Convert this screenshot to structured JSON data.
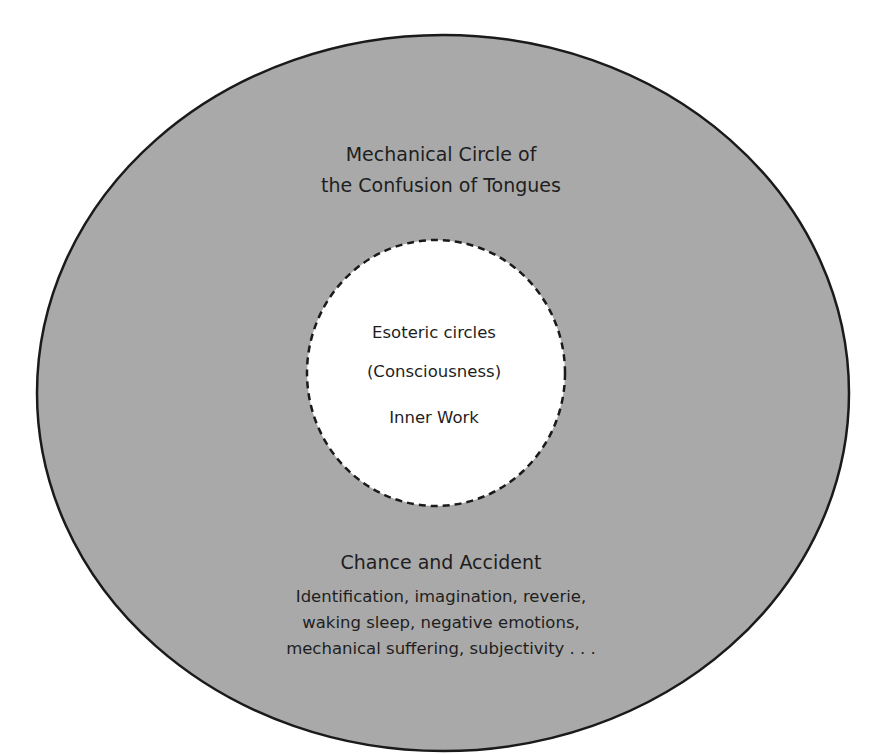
{
  "colors": {
    "outer_fill": "#a9a9a9",
    "outer_stroke": "#1a1a1a",
    "inner_fill": "#ffffff",
    "inner_stroke": "#1a1a1a",
    "text": "#1e1e1e"
  },
  "outer_circle": {
    "title_lines": [
      "Mechanical Circle of",
      "the Confusion of Tongues"
    ]
  },
  "inner_circle": {
    "title": "Esoteric circles",
    "subtitle": "(Consciousness)",
    "label": "Inner Work",
    "border_style": "dashed"
  },
  "bottom_section": {
    "title": "Chance and Accident",
    "description_lines": [
      "Identification, imagination, reverie,",
      "waking sleep, negative emotions,",
      "mechanical suffering, subjectivity . . ."
    ]
  }
}
